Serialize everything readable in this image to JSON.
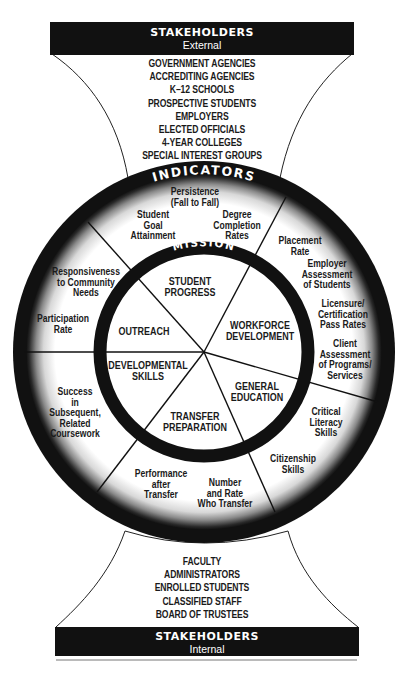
{
  "external_stakeholders": {
    "title": "STAKEHOLDERS",
    "subtitle": "External",
    "items": [
      "GOVERNMENT AGENCIES",
      "ACCREDITING AGENCIES",
      "K–12 SCHOOLS",
      "PROSPECTIVE STUDENTS",
      "EMPLOYERS",
      "ELECTED OFFICIALS",
      "4-YEAR COLLEGES",
      "SPECIAL INTEREST GROUPS"
    ]
  },
  "indicators": {
    "title": "INDICATORS",
    "items": {
      "persistence": [
        "Persistence",
        "(Fall to Fall)"
      ],
      "goal_attainment": [
        "Student",
        "Goal",
        "Attainment"
      ],
      "degree_completion": [
        "Degree",
        "Completion",
        "Rates"
      ],
      "placement": [
        "Placement",
        "Rate"
      ],
      "employer_assessment": [
        "Employer",
        "Assessment",
        "of Students"
      ],
      "licensure": [
        "Licensure/",
        "Certification",
        "Pass Rates"
      ],
      "client_assessment": [
        "Client",
        "Assessment",
        "of Programs/",
        "Services"
      ],
      "critical_literacy": [
        "Critical",
        "Literacy",
        "Skills"
      ],
      "citizenship": [
        "Citizenship",
        "Skills"
      ],
      "number_rate_transfer": [
        "Number",
        "and Rate",
        "Who Transfer"
      ],
      "performance_after_transfer": [
        "Performance",
        "after",
        "Transfer"
      ],
      "success_subsequent": [
        "Success",
        "in",
        "Subsequent,",
        "Related",
        "Coursework"
      ],
      "participation": [
        "Participation",
        "Rate"
      ],
      "responsiveness": [
        "Responsiveness",
        "to Community",
        "Needs"
      ]
    }
  },
  "mission": {
    "title": "MISSION",
    "segments": {
      "student_progress": [
        "STUDENT",
        "PROGRESS"
      ],
      "workforce_development": [
        "WORKFORCE",
        "DEVELOPMENT"
      ],
      "general_education": [
        "GENERAL",
        "EDUCATION"
      ],
      "transfer_preparation": [
        "TRANSFER",
        "PREPARATION"
      ],
      "developmental_skills": [
        "DEVELOPMENTAL",
        "SKILLS"
      ],
      "outreach": [
        "OUTREACH"
      ]
    }
  },
  "internal_stakeholders": {
    "title": "STAKEHOLDERS",
    "subtitle": "Internal",
    "items": [
      "FACULTY",
      "ADMINISTRATORS",
      "ENROLLED STUDENTS",
      "CLASSIFIED STAFF",
      "BOARD OF TRUSTEES"
    ]
  },
  "colors": {
    "ink": "#111111",
    "paper": "#ffffff"
  }
}
